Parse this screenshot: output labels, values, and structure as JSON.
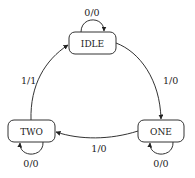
{
  "diagram": {
    "type": "state-machine",
    "colors": {
      "background": "#ffffff",
      "stroke": "#333333",
      "text": "#222222"
    },
    "states": [
      {
        "id": "idle",
        "label": "IDLE"
      },
      {
        "id": "one",
        "label": "ONE"
      },
      {
        "id": "two",
        "label": "TWO"
      }
    ],
    "transitions": [
      {
        "from": "idle",
        "to": "idle",
        "label": "0/0"
      },
      {
        "from": "idle",
        "to": "one",
        "label": "1/0"
      },
      {
        "from": "one",
        "to": "one",
        "label": "0/0"
      },
      {
        "from": "one",
        "to": "two",
        "label": "1/0"
      },
      {
        "from": "two",
        "to": "two",
        "label": "0/0"
      },
      {
        "from": "two",
        "to": "idle",
        "label": "1/1"
      }
    ]
  }
}
